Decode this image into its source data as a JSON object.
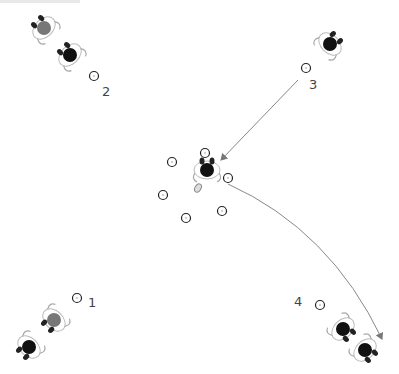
{
  "diagram": {
    "type": "drill-diagram",
    "colors": {
      "cone": "#222222",
      "player_dark": "#111111",
      "player_gray": "#777777",
      "arrow": "#888888",
      "label": "#444444"
    },
    "labels": [
      {
        "id": "1",
        "text": "1",
        "x": 88,
        "y": 296
      },
      {
        "id": "2",
        "text": "2",
        "x": 102,
        "y": 85
      },
      {
        "id": "3",
        "text": "3",
        "x": 309,
        "y": 78
      },
      {
        "id": "4",
        "text": "4",
        "x": 294,
        "y": 295
      }
    ],
    "cones": [
      {
        "x": 94,
        "y": 76
      },
      {
        "x": 306,
        "y": 68
      },
      {
        "x": 77,
        "y": 298
      },
      {
        "x": 320,
        "y": 305
      },
      {
        "x": 205,
        "y": 153
      },
      {
        "x": 172,
        "y": 162
      },
      {
        "x": 228,
        "y": 178
      },
      {
        "x": 163,
        "y": 195
      },
      {
        "x": 186,
        "y": 218
      },
      {
        "x": 222,
        "y": 211
      }
    ],
    "players": [
      {
        "x": 44,
        "y": 28,
        "color": "gray",
        "angle": 135
      },
      {
        "x": 70,
        "y": 55,
        "color": "dark",
        "angle": 135
      },
      {
        "x": 330,
        "y": 44,
        "color": "dark",
        "angle": 225
      },
      {
        "x": 207,
        "y": 170,
        "color": "dark",
        "angle": 180
      },
      {
        "x": 54,
        "y": 320,
        "color": "gray",
        "angle": 45
      },
      {
        "x": 29,
        "y": 347,
        "color": "dark",
        "angle": 45
      },
      {
        "x": 343,
        "y": 329,
        "color": "dark",
        "angle": 315
      },
      {
        "x": 365,
        "y": 350,
        "color": "dark",
        "angle": 315
      }
    ],
    "ball": {
      "x": 198,
      "y": 188
    },
    "arrows": [
      {
        "type": "straight",
        "from": [
          298,
          80
        ],
        "to": [
          221,
          160
        ]
      },
      {
        "type": "curve",
        "from": [
          228,
          184
        ],
        "control": [
          330,
          230
        ],
        "to": [
          382,
          339
        ]
      }
    ]
  }
}
